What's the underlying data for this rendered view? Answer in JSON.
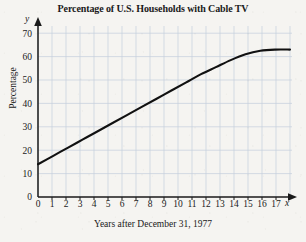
{
  "figure": {
    "title": "Percentage of U.S. Households with Cable TV",
    "x_caption": "Years after December 31, 1977",
    "y_label": "Percentage",
    "x_axis_variable": "x",
    "y_axis_variable": "y"
  },
  "colors": {
    "page_background": "#f5f4f1",
    "grid": "#c4cfdc",
    "axis": "#1a1a1a",
    "curve": "#111111",
    "text": "#1a1a1a"
  },
  "chart_data": {
    "type": "line",
    "title": "Percentage of U.S. Households with Cable TV",
    "xlabel": "Years after December 31, 1977",
    "ylabel": "Percentage",
    "xlim": [
      0,
      17
    ],
    "ylim": [
      0,
      75
    ],
    "grid": true,
    "legend": "none",
    "x_ticks": [
      "0",
      "1",
      "2",
      "3",
      "4",
      "5",
      "6",
      "7",
      "8",
      "9",
      "10",
      "11",
      "12",
      "13",
      "14",
      "15",
      "16",
      "17"
    ],
    "y_ticks": [
      "0",
      "10",
      "20",
      "30",
      "40",
      "50",
      "60",
      "70"
    ],
    "series": [
      {
        "name": "Percentage of U.S. households with cable TV",
        "x": [
          0,
          1,
          2,
          3,
          4,
          5,
          6,
          7,
          8,
          9,
          10,
          11,
          12,
          13,
          14,
          15,
          16,
          17
        ],
        "values": [
          14.0,
          17.5,
          21.0,
          24.5,
          28.0,
          31.5,
          35.0,
          38.5,
          42.0,
          45.5,
          49.0,
          52.5,
          55.5,
          58.5,
          61.0,
          62.5,
          63.0,
          63.0
        ]
      }
    ]
  }
}
